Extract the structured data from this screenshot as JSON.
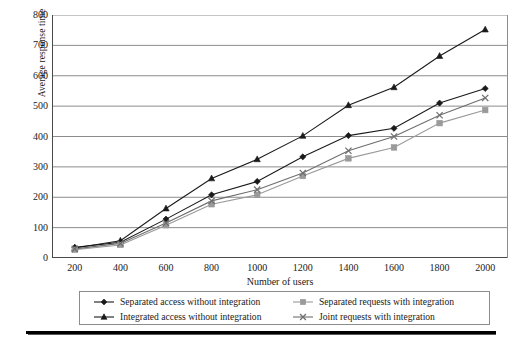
{
  "chart_data": {
    "type": "line",
    "title": "",
    "xlabel": "Number of users",
    "ylabel": "Average response time",
    "x": [
      200,
      400,
      600,
      800,
      1000,
      1200,
      1400,
      1600,
      1800,
      2000
    ],
    "categories": [
      "200",
      "400",
      "600",
      "800",
      "1000",
      "1200",
      "1400",
      "1600",
      "1800",
      "2000"
    ],
    "xlim": [
      100,
      2100
    ],
    "ylim": [
      0,
      800
    ],
    "y_ticks": [
      0,
      100,
      200,
      300,
      400,
      500,
      600,
      700,
      800
    ],
    "x_ticks": [
      200,
      400,
      600,
      800,
      1000,
      1200,
      1400,
      1600,
      1800,
      2000
    ],
    "grid": "horizontal",
    "legend_position": "below-plot",
    "series": [
      {
        "name": "Separated access without integration",
        "marker": "diamond",
        "color": "#1a1a1a",
        "values": [
          35,
          52,
          128,
          208,
          252,
          333,
          403,
          427,
          510,
          558
        ]
      },
      {
        "name": "Integrated access without integration",
        "marker": "triangle",
        "color": "#1a1a1a",
        "values": [
          33,
          57,
          163,
          262,
          325,
          402,
          503,
          562,
          665,
          752
        ]
      },
      {
        "name": "Separated requests with integration",
        "marker": "square",
        "color": "#9a9a9a",
        "values": [
          27,
          43,
          108,
          177,
          208,
          270,
          328,
          364,
          444,
          487
        ]
      },
      {
        "name": "Joint requests with integration",
        "marker": "x",
        "color": "#6e6e6e",
        "values": [
          30,
          48,
          115,
          188,
          225,
          280,
          353,
          400,
          470,
          527
        ]
      }
    ]
  },
  "axes": {
    "y_title": "Average response time",
    "x_title": "Number of users",
    "y_tick_labels": [
      "800",
      "700",
      "600",
      "500",
      "400",
      "300",
      "200",
      "100",
      "0"
    ],
    "x_tick_labels": [
      "200",
      "400",
      "600",
      "800",
      "1000",
      "1200",
      "1400",
      "1600",
      "1800",
      "2000"
    ]
  },
  "legend": {
    "entries": [
      {
        "label": "Separated access without integration",
        "marker": "diamond",
        "color": "#1a1a1a"
      },
      {
        "label": "Integrated access without integration",
        "marker": "triangle",
        "color": "#1a1a1a"
      },
      {
        "label": "Separated requests with integration",
        "marker": "square",
        "color": "#9a9a9a"
      },
      {
        "label": "Joint requests with integration",
        "marker": "x",
        "color": "#6e6e6e"
      }
    ]
  },
  "style": {
    "grid_color": "#8c8c8c",
    "axis_color": "#4a4a4a",
    "text_color": "#1a1a1a",
    "background": "#ffffff",
    "rule_color": "#000000"
  }
}
